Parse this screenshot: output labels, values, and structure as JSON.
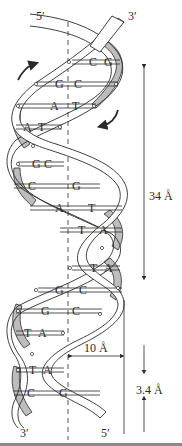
{
  "figure": {
    "strand_ends": {
      "top_left": "5′",
      "top_right": "3′",
      "bottom_left": "3′",
      "bottom_right": "5′"
    },
    "dimensions": {
      "pitch_label": "34 Å",
      "radius_label": "10 Å",
      "rise_label": "3.4 Å"
    },
    "base_pairs": [
      {
        "left": "C",
        "right": "G"
      },
      {
        "left": "G",
        "right": "C"
      },
      {
        "left": "A",
        "right": "T"
      },
      {
        "left": "A",
        "right": "T"
      },
      {
        "left": "G",
        "right": "C"
      },
      {
        "left": "C",
        "right": "G"
      },
      {
        "left": "A",
        "right": "T"
      },
      {
        "left": "T",
        "right": "A"
      },
      {
        "left": "T",
        "right": "A"
      },
      {
        "left": "G",
        "right": "C"
      },
      {
        "left": "G",
        "right": "C"
      },
      {
        "left": "T",
        "right": "A"
      },
      {
        "left": "T",
        "right": "A"
      },
      {
        "left": "C",
        "right": "G"
      }
    ],
    "colors": {
      "ink": "#2a2a2a",
      "ribbon_fill": "#ffffff",
      "ribbon_shade": "#bdbdbd",
      "rule": "#8a8a8a"
    }
  }
}
